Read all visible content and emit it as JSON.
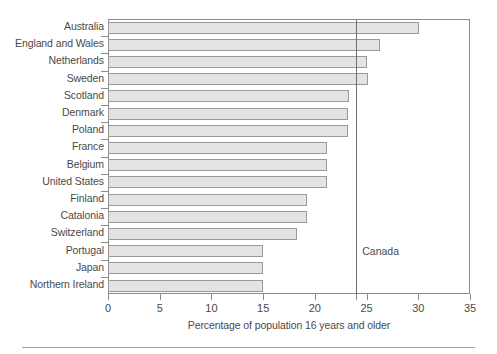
{
  "chart_data": {
    "type": "bar",
    "orientation": "horizontal",
    "title": "",
    "xlabel": "Percentage of population 16 years and older",
    "ylabel": "",
    "xlim": [
      0,
      35
    ],
    "xticks": [
      0,
      5,
      10,
      15,
      20,
      25,
      30,
      35
    ],
    "xtick_labels": [
      "0",
      "5",
      "10",
      "15",
      "20",
      "25",
      "30",
      "35"
    ],
    "grid": false,
    "legend": null,
    "categories": [
      "Australia",
      "England and Wales",
      "Netherlands",
      "Sweden",
      "Scotland",
      "Denmark",
      "Poland",
      "France",
      "Belgium",
      "United States",
      "Finland",
      "Catalonia",
      "Switzerland",
      "Portugal",
      "Japan",
      "Northern Ireland"
    ],
    "values": [
      30.1,
      26.3,
      25.0,
      25.1,
      23.3,
      23.2,
      23.2,
      21.2,
      21.2,
      21.2,
      19.2,
      19.2,
      18.3,
      15.0,
      15.0,
      15.0
    ],
    "annotations": [
      {
        "name": "canada-reference",
        "label": "Canada",
        "value": 24.0,
        "type": "vertical-line"
      }
    ],
    "bar_fill": "#e3e3e3",
    "bar_stroke": "#9a9a9a",
    "axis_color": "#8c8c8c",
    "text_color": "#4a4a4a"
  }
}
